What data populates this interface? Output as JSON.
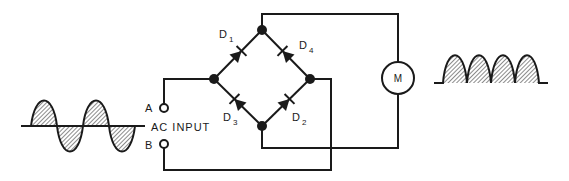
{
  "diagram": {
    "type": "full-wave bridge rectifier driving DC motor",
    "input": {
      "label": "AC INPUT",
      "terminal_a": "A",
      "terminal_b": "B",
      "waveform": "AC sine wave, 2 full cycles, shaded"
    },
    "diodes": [
      {
        "id": "D1",
        "label": "D",
        "sub": "1",
        "from": "left-node",
        "to": "top-node"
      },
      {
        "id": "D4",
        "label": "D",
        "sub": "4",
        "from": "right-node",
        "to": "top-node"
      },
      {
        "id": "D3",
        "label": "D",
        "sub": "3",
        "from": "bottom-node",
        "to": "left-node"
      },
      {
        "id": "D2",
        "label": "D",
        "sub": "2",
        "from": "bottom-node",
        "to": "right-node"
      }
    ],
    "load": {
      "symbol": "M",
      "name": "motor"
    },
    "output": {
      "waveform": "full-wave rectified pulses, 4 humps, shaded"
    },
    "colors": {
      "line": "#1a1a1a",
      "background": "#ffffff",
      "hatch": "#1a1a1a"
    }
  }
}
